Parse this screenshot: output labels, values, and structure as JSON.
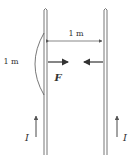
{
  "diagram": {
    "wire_separation_label": "1 m",
    "segment_length_label": "1 m",
    "force_label": "F",
    "current_left_label": "I",
    "current_right_label": "I",
    "colors": {
      "stroke": "#555555",
      "text": "#333333",
      "background": "#ffffff"
    }
  }
}
